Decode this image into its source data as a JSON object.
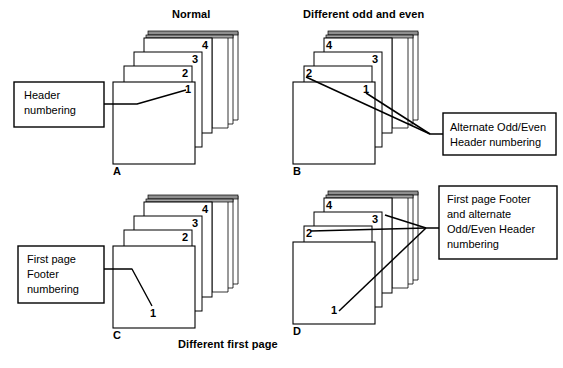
{
  "figure": {
    "title_top_left": "Normal",
    "title_top_right": "Different odd and even",
    "caption_bottom": "Different first page",
    "stroke_color": "#000000",
    "page_fill": "#ffffff",
    "page_edge_fill": "#9a9a9a",
    "background": "#ffffff"
  },
  "quadrants": [
    {
      "id": "A",
      "letter": "A",
      "heading": "Normal",
      "callout": {
        "lines": [
          "Header",
          "numbering"
        ],
        "line1": "Header",
        "line2": "numbering"
      },
      "page_numbers": [
        "1",
        "2",
        "3",
        "4"
      ],
      "number_positions": [
        "right",
        "right",
        "right",
        "right"
      ],
      "number_placement": "header"
    },
    {
      "id": "B",
      "letter": "B",
      "heading": "Different odd and even",
      "callout": {
        "lines": [
          "Alternate Odd/Even",
          "Header numbering"
        ],
        "line1": "Alternate Odd/Even",
        "line2": "Header numbering"
      },
      "page_numbers": [
        "1",
        "2",
        "3",
        "4"
      ],
      "number_positions": [
        "right",
        "left",
        "right",
        "left"
      ],
      "number_placement": "header"
    },
    {
      "id": "C",
      "letter": "C",
      "heading": "Different first page",
      "callout": {
        "lines": [
          "First page",
          "Footer",
          "numbering"
        ],
        "line1": "First page",
        "line2": "Footer",
        "line3": "numbering"
      },
      "page_numbers": [
        "1",
        "2",
        "3",
        "4"
      ],
      "number_positions": [
        "footer-center",
        "right",
        "right",
        "right"
      ],
      "number_placement": "first-page-footer"
    },
    {
      "id": "D",
      "letter": "D",
      "heading": "Different first page and different odd and even",
      "callout": {
        "lines": [
          "First page Footer",
          "and alternate",
          "Odd/Even Header",
          "numbering"
        ],
        "line1": "First page Footer",
        "line2": "and alternate",
        "line3": "Odd/Even Header",
        "line4": "numbering"
      },
      "page_numbers": [
        "1",
        "2",
        "3",
        "4"
      ],
      "number_positions": [
        "footer-left",
        "left",
        "right",
        "left"
      ],
      "number_placement": "first-page-footer-and-odd-even-header"
    }
  ],
  "labels": {
    "a_num_1": "1",
    "a_num_2": "2",
    "a_num_3": "3",
    "a_num_4": "4",
    "b_num_1": "1",
    "b_num_2": "2",
    "b_num_3": "3",
    "b_num_4": "4",
    "c_num_1": "1",
    "c_num_2": "2",
    "c_num_3": "3",
    "c_num_4": "4",
    "d_num_1": "1",
    "d_num_2": "2",
    "d_num_3": "3",
    "d_num_4": "4",
    "letter_a": "A",
    "letter_b": "B",
    "letter_c": "C",
    "letter_d": "D"
  }
}
